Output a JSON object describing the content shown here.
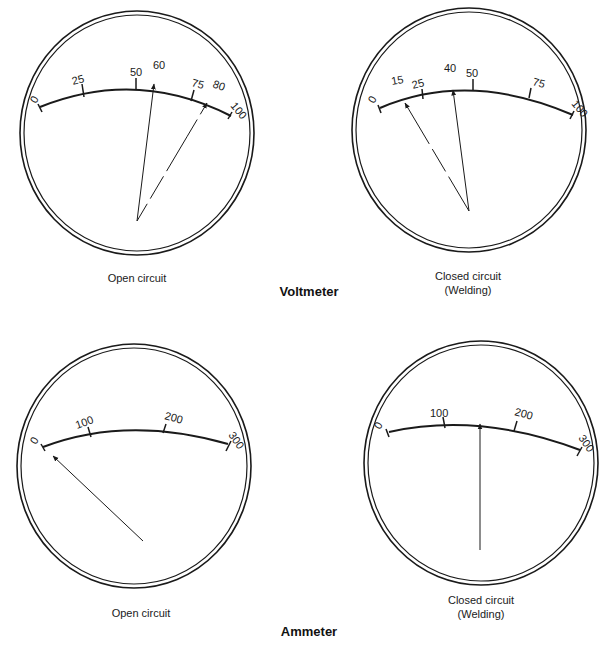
{
  "voltmeter": {
    "title": "Voltmeter",
    "open": {
      "caption": "Open circuit",
      "scale_labels": [
        "0",
        "25",
        "50",
        "75",
        "100"
      ],
      "pointer_labels": [
        "60",
        "80"
      ],
      "solid_pointer_value": "60",
      "dashed_pointer_value": "80"
    },
    "closed": {
      "caption_line1": "Closed circuit",
      "caption_line2": "(Welding)",
      "scale_labels": [
        "0",
        "25",
        "50",
        "75",
        "100"
      ],
      "pointer_labels": [
        "15",
        "40"
      ],
      "solid_pointer_value": "40",
      "dashed_pointer_value": "15"
    }
  },
  "ammeter": {
    "title": "Ammeter",
    "open": {
      "caption": "Open circuit",
      "scale_labels": [
        "0",
        "100",
        "200",
        "300"
      ],
      "pointer_value": "0"
    },
    "closed": {
      "caption_line1": "Closed circuit",
      "caption_line2": "(Welding)",
      "scale_labels": [
        "0",
        "100",
        "200",
        "300"
      ],
      "pointer_value": "150"
    }
  }
}
